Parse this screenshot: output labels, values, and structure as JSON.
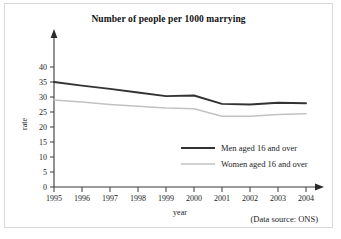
{
  "chart_data": {
    "type": "line",
    "title": "Number of people per 1000 marrying",
    "xlabel": "year",
    "ylabel": "rate",
    "x": [
      "1995",
      "1996",
      "1997",
      "1998",
      "1999",
      "2000",
      "2001",
      "2002",
      "2003",
      "2004"
    ],
    "categories": [
      "1995",
      "1996",
      "1997",
      "1998",
      "1999",
      "2000",
      "2001",
      "2002",
      "2003",
      "2004"
    ],
    "xlim": [
      1995,
      2004
    ],
    "ylim": [
      0,
      40
    ],
    "yticks": [
      "0",
      "5",
      "10",
      "15",
      "20",
      "25",
      "30",
      "35",
      "40"
    ],
    "ytick_values": [
      0,
      5,
      10,
      15,
      20,
      25,
      30,
      35,
      40
    ],
    "grid": false,
    "legend_position": "center-right-inside",
    "series": [
      {
        "name": "Men aged 16 and over",
        "color": "#333333",
        "values": [
          35.0,
          33.8,
          32.7,
          31.5,
          30.3,
          30.5,
          27.7,
          27.5,
          28.1,
          27.9
        ]
      },
      {
        "name": "Women aged 16 and over",
        "color": "#c2c2c2",
        "values": [
          29.0,
          28.3,
          27.5,
          26.9,
          26.3,
          26.1,
          23.6,
          23.6,
          24.2,
          24.4
        ]
      }
    ],
    "annotations": [
      "(Data source: ONS)"
    ]
  },
  "figure": {
    "source_note": "(Data source: ONS)",
    "axis_arrowheads": true,
    "background_color": "#ffffff",
    "border_color": "#d8d8d8"
  }
}
